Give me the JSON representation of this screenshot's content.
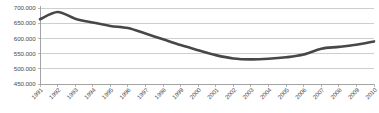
{
  "chart_data": {
    "type": "line",
    "title": "",
    "subtitle": "",
    "xlabel": "",
    "ylabel": "",
    "categories": [
      "1991",
      "1992",
      "1993",
      "1994",
      "1995",
      "1996",
      "1997",
      "1998",
      "1999",
      "2000",
      "2001",
      "2002",
      "2003",
      "2004",
      "2005",
      "2006",
      "2007",
      "2008",
      "2009",
      "2010"
    ],
    "values": [
      663000,
      687000,
      665000,
      652000,
      641000,
      634000,
      616000,
      597000,
      578000,
      561000,
      545000,
      534000,
      531000,
      533000,
      538000,
      547000,
      566000,
      572000,
      579000,
      590000
    ],
    "series": [
      {
        "name": "series-1",
        "color": "#474747",
        "values": [
          663000,
          687000,
          665000,
          652000,
          641000,
          634000,
          616000,
          597000,
          578000,
          561000,
          545000,
          534000,
          531000,
          533000,
          538000,
          547000,
          566000,
          572000,
          579000,
          590000
        ]
      }
    ],
    "ylim": [
      450000,
      700000
    ],
    "ytick_values": [
      450000,
      500000,
      550000,
      600000,
      650000,
      700000
    ],
    "ytick_labels": [
      "450.000",
      "500.000",
      "550.000",
      "600.000",
      "650.000",
      "700.000"
    ],
    "grid": "horizontal",
    "legend": "none",
    "number_format": "european-dot-thousands",
    "xtick_rotation_deg": 45
  },
  "plot": {
    "left": 40,
    "right": 374,
    "top": 8,
    "bottom": 84
  },
  "colors": {
    "line": "#474747",
    "gridline": "#b9b9b9",
    "axis": "#9a9a9a",
    "tick_text": "#4a4a4a",
    "background": "#ffffff"
  }
}
